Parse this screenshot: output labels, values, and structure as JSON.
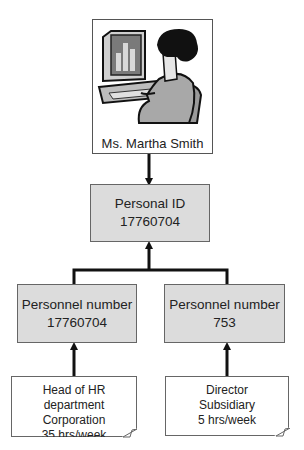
{
  "diagram": {
    "person": {
      "name": "Ms. Martha Smith",
      "icon": "person-at-computer-illustration"
    },
    "personal_id": {
      "label": "Personal ID",
      "value": "17760704"
    },
    "personnel": [
      {
        "label": "Personnel number",
        "value": "17760704",
        "note": {
          "line1": "Head of HR department",
          "line2": "Corporation",
          "line3": "35 hrs/week"
        }
      },
      {
        "label": "Personnel number",
        "value": "753",
        "note": {
          "line1": "Director",
          "line2": "Subsidiary",
          "line3": "5 hrs/week"
        }
      }
    ],
    "colors": {
      "box_fill": "#dcdcdc",
      "box_border": "#666666",
      "connector": "#111111",
      "note_fill": "#ffffff"
    }
  }
}
